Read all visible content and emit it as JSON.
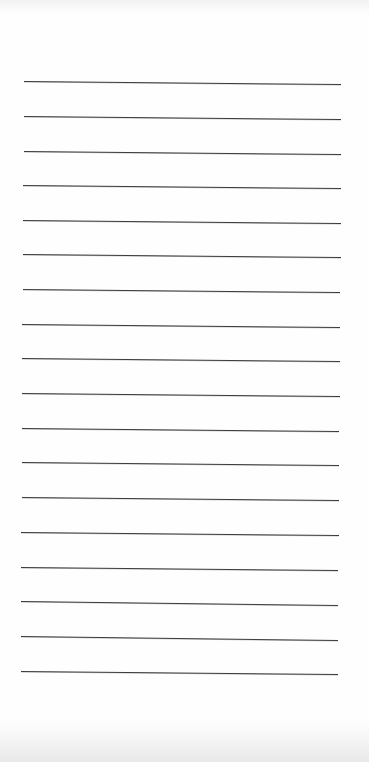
{
  "document": {
    "type": "lined-paper",
    "paper_color": "#fefefe",
    "line_color": "#3c3c3c",
    "line_count": 18,
    "top_bleed_text": "",
    "lines": [
      {
        "y_left": 81,
        "y_right": 84,
        "x_start": 24,
        "x_end": 341
      },
      {
        "y_left": 116,
        "y_right": 119,
        "x_start": 24,
        "x_end": 341
      },
      {
        "y_left": 151,
        "y_right": 154,
        "x_start": 24,
        "x_end": 341
      },
      {
        "y_left": 185,
        "y_right": 188,
        "x_start": 23,
        "x_end": 341
      },
      {
        "y_left": 220,
        "y_right": 223,
        "x_start": 23,
        "x_end": 341
      },
      {
        "y_left": 254,
        "y_right": 257,
        "x_start": 23,
        "x_end": 341
      },
      {
        "y_left": 289,
        "y_right": 292,
        "x_start": 23,
        "x_end": 340
      },
      {
        "y_left": 324,
        "y_right": 327,
        "x_start": 22,
        "x_end": 340
      },
      {
        "y_left": 358,
        "y_right": 361,
        "x_start": 22,
        "x_end": 340
      },
      {
        "y_left": 393,
        "y_right": 396,
        "x_start": 22,
        "x_end": 340
      },
      {
        "y_left": 428,
        "y_right": 431,
        "x_start": 22,
        "x_end": 339
      },
      {
        "y_left": 462,
        "y_right": 465,
        "x_start": 22,
        "x_end": 339
      },
      {
        "y_left": 497,
        "y_right": 500,
        "x_start": 22,
        "x_end": 339
      },
      {
        "y_left": 532,
        "y_right": 535,
        "x_start": 21,
        "x_end": 339
      },
      {
        "y_left": 567,
        "y_right": 570,
        "x_start": 21,
        "x_end": 338
      },
      {
        "y_left": 601,
        "y_right": 605,
        "x_start": 21,
        "x_end": 338
      },
      {
        "y_left": 636,
        "y_right": 640,
        "x_start": 21,
        "x_end": 338
      },
      {
        "y_left": 671,
        "y_right": 674,
        "x_start": 21,
        "x_end": 338
      }
    ]
  }
}
